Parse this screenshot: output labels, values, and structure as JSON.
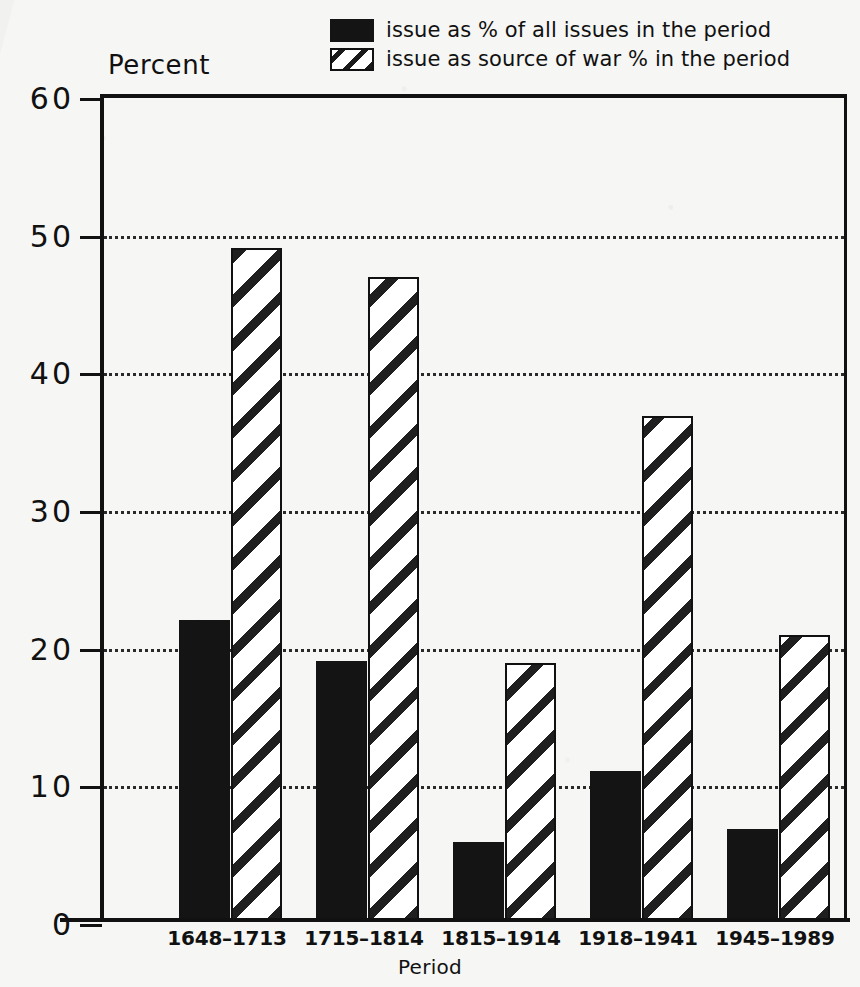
{
  "chart_data": {
    "type": "bar",
    "title": "",
    "xlabel": "Period",
    "ylabel": "Percent",
    "ylim": [
      0,
      60
    ],
    "yticks": [
      0,
      10,
      20,
      30,
      40,
      50,
      60
    ],
    "ytick_labels": [
      "0",
      "10",
      "20",
      "30",
      "40",
      "50",
      "60"
    ],
    "grid": "horizontal-dotted",
    "legend_position": "top-center",
    "categories": [
      "1648–1713",
      "1715–1814",
      "1815–1914",
      "1918–1941",
      "1945–1989"
    ],
    "series": [
      {
        "name": "issue as % of all issues in the period",
        "style": "solid-black",
        "values": [
          21.8,
          18.8,
          5.7,
          10.8,
          6.6
        ]
      },
      {
        "name": "issue as source of war % in the period",
        "style": "diagonal-hatch",
        "values": [
          48.8,
          46.7,
          18.7,
          36.6,
          20.7
        ]
      }
    ]
  },
  "legend": {
    "items": [
      {
        "label": "issue as % of all issues in the period",
        "swatch": "solid-black-swatch"
      },
      {
        "label": "issue as source of war % in the period",
        "swatch": "hatched-swatch"
      }
    ]
  },
  "axes": {
    "y_title": "Percent",
    "x_title": "Period"
  },
  "colors": {
    "ink": "#111111",
    "bar_solid": "#141414",
    "bar_hatch_stroke": "#1f1f1f",
    "bar_hatch_fill": "#ffffff",
    "paper": "#f6f6f4"
  }
}
